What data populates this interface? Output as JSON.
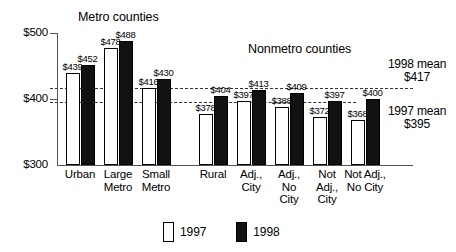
{
  "chart_data": {
    "type": "bar",
    "title": "",
    "xlabel": "",
    "ylabel": "",
    "ylim": [
      300,
      500
    ],
    "grid": false,
    "y_ticks": [
      "$300",
      "$400",
      "$500"
    ],
    "legend_position": "bottom-center",
    "categories": [
      "Urban",
      "Large Metro",
      "Small Metro",
      "Rural",
      "Adj., City",
      "Adj., No City",
      "Not Adj., City",
      "Not Adj., No City"
    ],
    "series": [
      {
        "name": "1997",
        "values": [
          439,
          478,
          416,
          378,
          397,
          388,
          372,
          368
        ]
      },
      {
        "name": "1998",
        "values": [
          452,
          488,
          430,
          404,
          413,
          409,
          397,
          400
        ]
      }
    ],
    "annotations": [
      {
        "name": "mean-1998",
        "label": "1998 mean",
        "value": 417,
        "value_label": "$417"
      },
      {
        "name": "mean-1997",
        "label": "1997 mean",
        "value": 395,
        "value_label": "$395"
      }
    ],
    "groups": [
      {
        "name": "metro",
        "title": "Metro counties"
      },
      {
        "name": "nonmetro",
        "title": "Nonmetro counties"
      }
    ]
  },
  "sections": {
    "metro_title": "Metro counties",
    "nonmetro_title": "Nonmetro counties"
  },
  "axis": {
    "y_ticks": [
      {
        "label": "$500"
      },
      {
        "label": "$400"
      },
      {
        "label": "$300"
      }
    ]
  },
  "categories": [
    {
      "id": "urban",
      "lines": [
        "Urban"
      ]
    },
    {
      "id": "large-metro",
      "lines": [
        "Large",
        "Metro"
      ]
    },
    {
      "id": "small-metro",
      "lines": [
        "Small",
        "Metro"
      ]
    },
    {
      "id": "rural",
      "lines": [
        "Rural"
      ]
    },
    {
      "id": "adj-city",
      "lines": [
        "Adj.,",
        "City"
      ]
    },
    {
      "id": "adj-no-city",
      "lines": [
        "Adj.,",
        "No",
        "City"
      ]
    },
    {
      "id": "not-adj-city",
      "lines": [
        "Not",
        "Adj.,",
        "City"
      ]
    },
    {
      "id": "not-adj-no-city",
      "lines": [
        "Not Adj.,",
        "No City"
      ]
    }
  ],
  "bars": [
    {
      "cat": "urban",
      "year": "1997",
      "value": 439,
      "label": "$439"
    },
    {
      "cat": "urban",
      "year": "1998",
      "value": 452,
      "label": "$452"
    },
    {
      "cat": "large-metro",
      "year": "1997",
      "value": 478,
      "label": "$478"
    },
    {
      "cat": "large-metro",
      "year": "1998",
      "value": 488,
      "label": "$488"
    },
    {
      "cat": "small-metro",
      "year": "1997",
      "value": 416,
      "label": "$416"
    },
    {
      "cat": "small-metro",
      "year": "1998",
      "value": 430,
      "label": "$430"
    },
    {
      "cat": "rural",
      "year": "1997",
      "value": 378,
      "label": "$378"
    },
    {
      "cat": "rural",
      "year": "1998",
      "value": 404,
      "label": "$404"
    },
    {
      "cat": "adj-city",
      "year": "1997",
      "value": 397,
      "label": "$397"
    },
    {
      "cat": "adj-city",
      "year": "1998",
      "value": 413,
      "label": "$413"
    },
    {
      "cat": "adj-no-city",
      "year": "1997",
      "value": 388,
      "label": "$388"
    },
    {
      "cat": "adj-no-city",
      "year": "1998",
      "value": 409,
      "label": "$409"
    },
    {
      "cat": "not-adj-city",
      "year": "1997",
      "value": 372,
      "label": "$372"
    },
    {
      "cat": "not-adj-city",
      "year": "1998",
      "value": 397,
      "label": "$397"
    },
    {
      "cat": "not-adj-no-city",
      "year": "1997",
      "value": 368,
      "label": "$368"
    },
    {
      "cat": "not-adj-no-city",
      "year": "1998",
      "value": 400,
      "label": "$400"
    }
  ],
  "means": {
    "y1998": {
      "label": "1998 mean",
      "value_label": "$417",
      "value": 417
    },
    "y1997": {
      "label": "1997 mean",
      "value_label": "$395",
      "value": 395
    }
  },
  "legend": {
    "items": [
      {
        "id": "legend-1997",
        "label": "1997",
        "swatch": "open-square"
      },
      {
        "id": "legend-1998",
        "label": "1998",
        "swatch": "filled-square"
      }
    ]
  },
  "colors": {
    "bar_1997_fill": "#ffffff",
    "bar_1998_fill": "#111111",
    "outline": "#000000",
    "axis": "#555555",
    "mean_line": "#333333"
  }
}
